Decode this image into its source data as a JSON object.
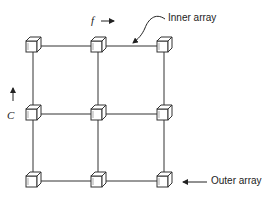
{
  "diagram": {
    "type": "grid-of-cubes",
    "rows": 3,
    "columns": 3,
    "labels": {
      "f_symbol": "f",
      "c_symbol": "C",
      "inner_array": "Inner array",
      "outer_array": "Outer array"
    },
    "colors": {
      "line": "#333333",
      "background": "#ffffff"
    },
    "nodes": [
      {
        "row": 0,
        "col": 0
      },
      {
        "row": 0,
        "col": 1
      },
      {
        "row": 0,
        "col": 2
      },
      {
        "row": 1,
        "col": 0
      },
      {
        "row": 1,
        "col": 1
      },
      {
        "row": 1,
        "col": 2
      },
      {
        "row": 2,
        "col": 0
      },
      {
        "row": 2,
        "col": 1
      },
      {
        "row": 2,
        "col": 2
      }
    ]
  }
}
